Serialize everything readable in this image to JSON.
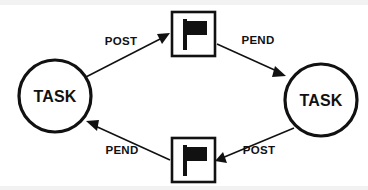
{
  "diagram": {
    "background_color": "#ffffff",
    "stroke_color": "#111111",
    "band_color": "#f2f2f2",
    "nodes": [
      {
        "id": "task-left",
        "kind": "circle",
        "label": "TASK",
        "cx": 55,
        "cy": 96,
        "r": 36
      },
      {
        "id": "flag-top",
        "kind": "flag-box",
        "label": "",
        "x": 172,
        "y": 12,
        "w": 43,
        "h": 44
      },
      {
        "id": "task-right",
        "kind": "circle",
        "label": "TASK",
        "cx": 321,
        "cy": 100,
        "r": 36
      },
      {
        "id": "flag-bottom",
        "kind": "flag-box",
        "label": "",
        "x": 172,
        "y": 138,
        "w": 43,
        "h": 44
      }
    ],
    "edges": [
      {
        "id": "edge-post-top",
        "label": "POST",
        "from": "task-left",
        "to": "flag-top",
        "x1": 82,
        "y1": 79,
        "x2": 169,
        "y2": 34,
        "label_x": 121,
        "label_y": 45
      },
      {
        "id": "edge-pend-top",
        "label": "PEND",
        "from": "flag-top",
        "to": "task-right",
        "x1": 217,
        "y1": 44,
        "x2": 284,
        "y2": 75,
        "label_x": 258,
        "label_y": 44
      },
      {
        "id": "edge-post-bottom",
        "label": "POST",
        "from": "task-right",
        "to": "flag-bottom",
        "x1": 294,
        "y1": 128,
        "x2": 217,
        "y2": 161,
        "label_x": 259,
        "label_y": 154
      },
      {
        "id": "edge-pend-bottom",
        "label": "PEND",
        "from": "flag-bottom",
        "to": "task-left",
        "x1": 170,
        "y1": 160,
        "x2": 87,
        "y2": 122,
        "label_x": 122,
        "label_y": 154
      }
    ]
  }
}
